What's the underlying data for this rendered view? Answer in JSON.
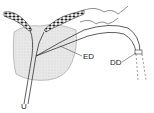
{
  "diagram": {
    "labels": {
      "ed": "ED",
      "dd": "DD",
      "u": "U"
    },
    "colors": {
      "line": "#333333",
      "gland_fill": "#e6e6e6",
      "dark_tissue": "#2a2a2a",
      "background": "#ffffff"
    }
  }
}
